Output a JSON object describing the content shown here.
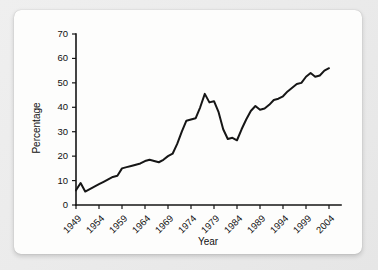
{
  "figure": {
    "background_color": "#e8e8e8",
    "card_color": "#fdfdfc",
    "line_color": "#161616"
  },
  "chart_data": {
    "type": "line",
    "title": "",
    "subtitle": "",
    "xlabel": "Year",
    "ylabel": "Percentage",
    "xlim": [
      1949,
      2004
    ],
    "ylim": [
      0,
      70
    ],
    "xticks": [
      1949,
      1954,
      1959,
      1964,
      1969,
      1974,
      1979,
      1984,
      1989,
      1994,
      1999,
      2004
    ],
    "yticks": [
      0,
      10,
      20,
      30,
      40,
      50,
      60,
      70
    ],
    "xtick_labels": [
      "1949",
      "1954",
      "1959",
      "1964",
      "1969",
      "1974",
      "1979",
      "1984",
      "1989",
      "1994",
      "1999",
      "2004"
    ],
    "ytick_labels": [
      "0",
      "10",
      "20",
      "30",
      "40",
      "50",
      "60",
      "70"
    ],
    "xtick_rotation": 45,
    "grid": false,
    "legend": null,
    "legend_position": "none",
    "annotations": [],
    "series": [
      {
        "name": "Percentage",
        "color": "#161616",
        "x": [
          1949,
          1950,
          1951,
          1952,
          1953,
          1954,
          1955,
          1956,
          1957,
          1958,
          1959,
          1960,
          1961,
          1962,
          1963,
          1964,
          1965,
          1966,
          1967,
          1968,
          1969,
          1970,
          1971,
          1972,
          1973,
          1974,
          1975,
          1976,
          1977,
          1978,
          1979,
          1980,
          1981,
          1982,
          1983,
          1984,
          1985,
          1986,
          1987,
          1988,
          1989,
          1990,
          1991,
          1992,
          1993,
          1994,
          1995,
          1996,
          1997,
          1998,
          1999,
          2000,
          2001,
          2002,
          2003,
          2004
        ],
        "values": [
          6.0,
          9.0,
          5.5,
          6.5,
          7.5,
          8.5,
          9.5,
          10.5,
          11.5,
          12.0,
          15.0,
          15.5,
          16.0,
          16.5,
          17.0,
          18.0,
          18.5,
          18.0,
          17.5,
          18.5,
          20.0,
          21.0,
          25.0,
          30.0,
          34.5,
          35.0,
          35.5,
          40.0,
          45.5,
          42.0,
          42.5,
          38.0,
          31.0,
          27.0,
          27.5,
          26.5,
          31.0,
          35.0,
          38.5,
          40.5,
          39.0,
          39.5,
          41.0,
          43.0,
          43.5,
          44.5,
          46.5,
          48.0,
          49.5,
          50.0,
          52.5,
          54.0,
          52.5,
          53.0,
          55.0,
          56.0
        ]
      }
    ]
  },
  "axis_titles": {
    "x": "Year",
    "y": "Percentage"
  }
}
